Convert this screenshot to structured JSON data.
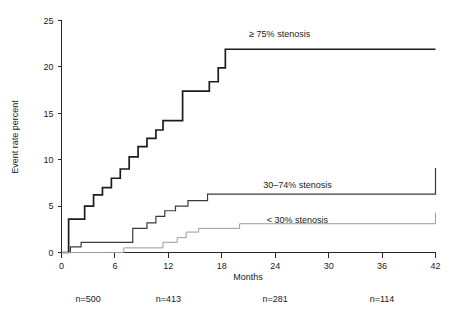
{
  "chart_data": {
    "type": "line",
    "title": "",
    "xlabel": "Months",
    "ylabel": "Event rate percent",
    "xlim": [
      0,
      42
    ],
    "ylim": [
      0,
      25
    ],
    "xticks": [
      0,
      6,
      12,
      18,
      24,
      30,
      36,
      42
    ],
    "xtick_labels": [
      "0",
      "6",
      "12",
      "18",
      "24",
      "30",
      "36",
      "42"
    ],
    "yticks": [
      0,
      5,
      10,
      15,
      20,
      25
    ],
    "ytick_labels": [
      "0",
      "5",
      "10",
      "15",
      "20",
      "25"
    ],
    "grid": false,
    "legend_position": "inline-annotations",
    "step_style": "post",
    "series": [
      {
        "name": "≥ 75% stenosis",
        "label": "≥ 75% stenosis",
        "label_x": 24.5,
        "label_y": 23.2,
        "color": "#1c1c1c",
        "x": [
          0,
          0.8,
          1.6,
          2.6,
          3.6,
          4.6,
          5.6,
          6.6,
          7.6,
          8.6,
          9.6,
          10.6,
          11.4,
          12.4,
          13.6,
          15.2,
          16.6,
          17.6,
          18.4,
          42
        ],
        "y": [
          0,
          3.6,
          3.6,
          5.0,
          6.2,
          7.0,
          8.0,
          9.0,
          10.3,
          11.4,
          12.3,
          13.2,
          14.2,
          14.2,
          17.4,
          17.4,
          18.4,
          19.9,
          21.9,
          21.9
        ]
      },
      {
        "name": "30–74% stenosis",
        "label": "30–74% stenosis",
        "label_x": 26.5,
        "label_y": 7.0,
        "color": "#3a3a3a",
        "x": [
          0,
          1.0,
          2.2,
          5.6,
          8.0,
          9.6,
          10.6,
          11.6,
          12.8,
          14.2,
          16.4,
          18.2,
          36.0,
          42
        ],
        "y": [
          0,
          0.6,
          1.1,
          1.1,
          2.6,
          3.2,
          3.9,
          4.5,
          5.0,
          5.6,
          6.3,
          6.3,
          6.3,
          9.1
        ]
      },
      {
        "name": "< 30% stenosis",
        "label": "< 30% stenosis",
        "label_x": 26.5,
        "label_y": 3.2,
        "color": "#9a9a9a",
        "x": [
          0,
          5.4,
          7.0,
          10.0,
          11.4,
          13.0,
          14.0,
          15.4,
          20.0,
          36.0,
          42
        ],
        "y": [
          0,
          0.0,
          0.5,
          0.5,
          1.1,
          1.6,
          2.2,
          2.6,
          3.1,
          3.1,
          4.3
        ]
      }
    ],
    "risk_table": {
      "entries": [
        {
          "label": "n=500",
          "x": 0
        },
        {
          "label": "n=413",
          "x": 12
        },
        {
          "label": "n=281",
          "x": 24
        },
        {
          "label": "n=114",
          "x": 36
        }
      ]
    }
  }
}
